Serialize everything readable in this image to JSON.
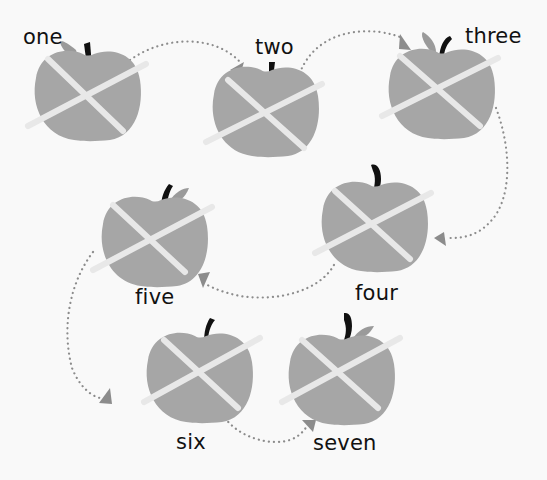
{
  "diagram": {
    "colors": {
      "background": "#f9f9f9",
      "apple_body": "#a6a6a6",
      "cross": "#e8e8e8",
      "stem": "#111111",
      "leaf": "#9a9a9a",
      "arrow": "#8c8c8c",
      "text": "#111111"
    },
    "apples": [
      {
        "label": "one",
        "order": 1
      },
      {
        "label": "two",
        "order": 2
      },
      {
        "label": "three",
        "order": 3
      },
      {
        "label": "four",
        "order": 4
      },
      {
        "label": "five",
        "order": 5
      },
      {
        "label": "six",
        "order": 6
      },
      {
        "label": "seven",
        "order": 7
      }
    ],
    "arrows": [
      {
        "from": "one",
        "to": "two"
      },
      {
        "from": "two",
        "to": "three"
      },
      {
        "from": "three",
        "to": "four"
      },
      {
        "from": "four",
        "to": "five"
      },
      {
        "from": "five",
        "to": "six"
      },
      {
        "from": "six",
        "to": "seven"
      }
    ]
  }
}
